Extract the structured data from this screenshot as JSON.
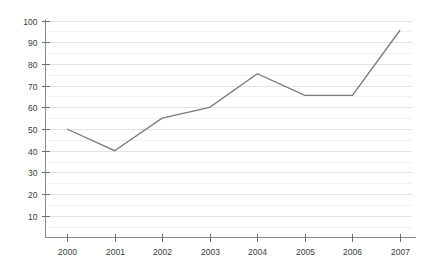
{
  "chart_data": {
    "type": "line",
    "title": "",
    "subtitle": "",
    "xlabel": "",
    "ylabel": "",
    "categories": [
      "2000",
      "2001",
      "2002",
      "2003",
      "2004",
      "2005",
      "2006",
      "2007"
    ],
    "x": [
      2000,
      2001,
      2002,
      2003,
      2004,
      2005,
      2006,
      2007
    ],
    "series": [
      {
        "name": "",
        "values": [
          50,
          40,
          55,
          60,
          75.5,
          65.5,
          65.5,
          95.5
        ],
        "color": "#7a7a7a"
      }
    ],
    "values": [
      50,
      40,
      55,
      60,
      75.5,
      65.5,
      65.5,
      95.5
    ],
    "ylim": [
      0,
      100
    ],
    "xlim": [
      2000,
      2007
    ],
    "ytick_labels": [
      "10",
      "20",
      "30",
      "40",
      "50",
      "60",
      "70",
      "80",
      "90",
      "100"
    ],
    "ytick_values": [
      10,
      20,
      30,
      40,
      50,
      60,
      70,
      80,
      90,
      100
    ],
    "xtick_labels": [
      "2000",
      "2001",
      "2002",
      "2003",
      "2004",
      "2005",
      "2006",
      "2007"
    ],
    "grid": true,
    "grid_major_step": 10,
    "grid_minor_step": 5,
    "legend": false,
    "legend_position": "none",
    "annotations": []
  },
  "colors": {
    "background": "#ffffff",
    "series": "#7a7a7a",
    "axis": "#8a8a8a",
    "grid_major": "#e3e3e3",
    "grid_minor": "#f1f1f1",
    "tick_text": "#3b3b3b"
  }
}
